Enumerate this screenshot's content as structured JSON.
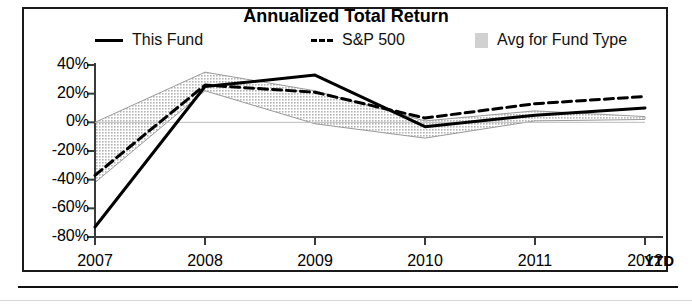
{
  "chart_data": {
    "type": "line",
    "title": "Annualized Total Return",
    "xlabel": "",
    "ylabel": "",
    "grid": false,
    "legend_position": "top",
    "x": [
      "2007",
      "2008",
      "2009",
      "2010",
      "2011",
      "2012"
    ],
    "categories": [
      "2007",
      "2008",
      "2009",
      "2010",
      "2011",
      "2012"
    ],
    "x_tick_suffix": "YTD",
    "ylim": [
      -80,
      40
    ],
    "ytick_values": [
      40,
      20,
      0,
      -20,
      -40,
      -60,
      -80
    ],
    "ytick_labels": [
      "40%",
      "20%",
      "0%",
      "-20%",
      "-40%",
      "-60%",
      "-80%"
    ],
    "series": [
      {
        "name": "This Fund",
        "style": "solid",
        "color": "#000000",
        "values": [
          -73,
          25,
          33,
          -3,
          5,
          10
        ]
      },
      {
        "name": "S&P 500",
        "style": "dashed",
        "color": "#000000",
        "values": [
          -37,
          26,
          21,
          3,
          13,
          18
        ]
      },
      {
        "name": "Avg for Fund Type",
        "style": "band",
        "color": "#c9c9c9",
        "upper": [
          0,
          35,
          22,
          1,
          8,
          4
        ],
        "lower": [
          -42,
          22,
          -1,
          -11,
          1,
          2
        ]
      }
    ]
  },
  "title": "Annualized Total Return",
  "legend": {
    "items": [
      {
        "label": "This Fund",
        "swatch": "solid-line-swatch"
      },
      {
        "label": "S&P 500",
        "swatch": "dashed-line-swatch"
      },
      {
        "label": "Avg for Fund Type",
        "swatch": "shaded-band-swatch"
      }
    ]
  },
  "axes": {
    "y_labels": [
      "40%",
      "20%",
      "0%",
      "-20%",
      "-40%",
      "-60%",
      "-80%"
    ],
    "x_labels": [
      "2007",
      "2008",
      "2009",
      "2010",
      "2011",
      "2012"
    ],
    "x_suffix": "YTD"
  }
}
